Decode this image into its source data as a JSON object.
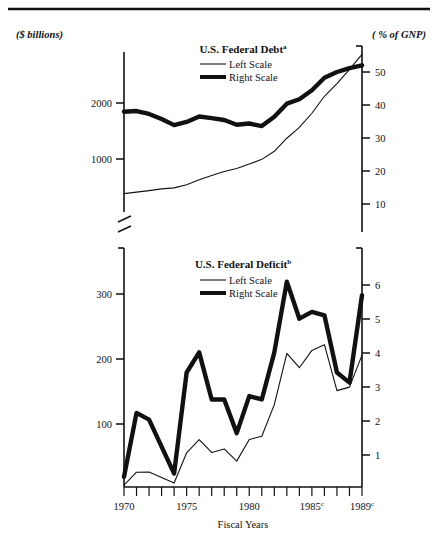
{
  "figure": {
    "top_rule": true,
    "left_unit_label": "($ billions)",
    "right_unit_label": "( % of GNP)",
    "x_axis_caption": "Fiscal Years",
    "background_color": "#ffffff",
    "ink_color": "#111111"
  },
  "panels": [
    {
      "id": "debt",
      "title": "U.S. Federal Debt",
      "title_superscript": "a",
      "legend": [
        {
          "label": "Left Scale",
          "style": "thin"
        },
        {
          "label": "Right Scale",
          "style": "thick"
        }
      ],
      "left_axis": {
        "label": "($ billions)",
        "ticks": [
          1000,
          2000
        ],
        "tick_labels": [
          "1000",
          "2000"
        ],
        "range": [
          0,
          3000
        ],
        "broken": true
      },
      "right_axis": {
        "label": "( % of GNP)",
        "ticks": [
          10,
          20,
          30,
          40,
          50
        ],
        "tick_labels": [
          "10",
          "20",
          "30",
          "40",
          "50"
        ],
        "range": [
          0,
          60
        ]
      }
    },
    {
      "id": "deficit",
      "title": "U.S. Federal Deficit",
      "title_superscript": "b",
      "legend": [
        {
          "label": "Left Scale",
          "style": "thin"
        },
        {
          "label": "Right Scale",
          "style": "thick"
        }
      ],
      "left_axis": {
        "label": "($ billions)",
        "ticks": [
          100,
          200,
          300
        ],
        "tick_labels": [
          "100",
          "200",
          "300"
        ],
        "range": [
          0,
          360
        ]
      },
      "right_axis": {
        "label": "( % of GNP)",
        "ticks": [
          1,
          2,
          3,
          4,
          5,
          6
        ],
        "tick_labels": [
          "1",
          "2",
          "3",
          "4",
          "5",
          "6"
        ],
        "range": [
          0,
          6.9
        ]
      }
    }
  ],
  "x_axis": {
    "caption": "Fiscal Years",
    "years": [
      1970,
      1971,
      1972,
      1973,
      1974,
      1975,
      1976,
      1977,
      1978,
      1979,
      1980,
      1981,
      1982,
      1983,
      1984,
      1985,
      1986,
      1987,
      1988,
      1989
    ],
    "tick_years": [
      1970,
      1971,
      1972,
      1973,
      1974,
      1975,
      1976,
      1977,
      1978,
      1979,
      1980,
      1981,
      1982,
      1983,
      1984,
      1985,
      1986,
      1987,
      1988,
      1989
    ],
    "labeled": [
      {
        "year": 1970,
        "text": "1970",
        "superscript": ""
      },
      {
        "year": 1975,
        "text": "1975",
        "superscript": ""
      },
      {
        "year": 1980,
        "text": "1980",
        "superscript": ""
      },
      {
        "year": 1985,
        "text": "1985",
        "superscript": "c"
      },
      {
        "year": 1989,
        "text": "1989",
        "superscript": "c"
      }
    ],
    "range": [
      1970,
      1989
    ]
  },
  "chart_data": [
    {
      "type": "line",
      "id": "debt",
      "title": "U.S. Federal Debt",
      "xlabel": "Fiscal Years",
      "ylabel": "($ billions)",
      "y2label": "( % of GNP)",
      "grid": false,
      "legend_position": "top-center",
      "x": [
        1970,
        1971,
        1972,
        1973,
        1974,
        1975,
        1976,
        1977,
        1978,
        1979,
        1980,
        1981,
        1982,
        1983,
        1984,
        1985,
        1986,
        1987,
        1988,
        1989
      ],
      "xlim": [
        1970,
        1989
      ],
      "ylim": [
        0,
        3000
      ],
      "y2lim": [
        0,
        60
      ],
      "series": [
        {
          "name": "Left Scale",
          "style": "thin",
          "axis": "left",
          "units": "$ billions",
          "values": [
            381,
            408,
            436,
            466,
            484,
            541,
            629,
            706,
            777,
            829,
            909,
            994,
            1137,
            1371,
            1564,
            1817,
            2120,
            2346,
            2601,
            2868
          ]
        },
        {
          "name": "Right Scale",
          "style": "thick",
          "axis": "right",
          "units": "% of GNP",
          "values": [
            37.6,
            37.8,
            36.9,
            35.3,
            33.4,
            34.4,
            36.1,
            35.6,
            35.0,
            33.5,
            33.9,
            33.1,
            36.0,
            40.1,
            41.5,
            44.3,
            48.2,
            50.0,
            51.2,
            52.1
          ]
        }
      ]
    },
    {
      "type": "line",
      "id": "deficit",
      "title": "U.S. Federal Deficit",
      "xlabel": "Fiscal Years",
      "ylabel": "($ billions)",
      "y2label": "( % of GNP)",
      "grid": false,
      "legend_position": "top-center",
      "x": [
        1970,
        1971,
        1972,
        1973,
        1974,
        1975,
        1976,
        1977,
        1978,
        1979,
        1980,
        1981,
        1982,
        1983,
        1984,
        1985,
        1986,
        1987,
        1988,
        1989
      ],
      "xlim": [
        1970,
        1989
      ],
      "ylim": [
        0,
        360
      ],
      "y2lim": [
        0,
        6.9
      ],
      "series": [
        {
          "name": "Left Scale",
          "style": "thin",
          "axis": "left",
          "units": "$ billions",
          "values": [
            2.8,
            23.0,
            23.4,
            14.9,
            6.1,
            53.2,
            73.7,
            53.7,
            59.2,
            40.2,
            73.8,
            79.0,
            128.0,
            207.8,
            185.4,
            212.3,
            221.2,
            149.8,
            155.2,
            205.0
          ]
        },
        {
          "name": "Right Scale",
          "style": "thick",
          "axis": "right",
          "units": "% of GNP",
          "values": [
            0.3,
            2.2,
            2.0,
            1.2,
            0.4,
            3.4,
            4.0,
            2.6,
            2.6,
            1.6,
            2.7,
            2.6,
            4.0,
            6.1,
            5.0,
            5.2,
            5.1,
            3.4,
            3.1,
            5.7
          ]
        }
      ]
    }
  ]
}
